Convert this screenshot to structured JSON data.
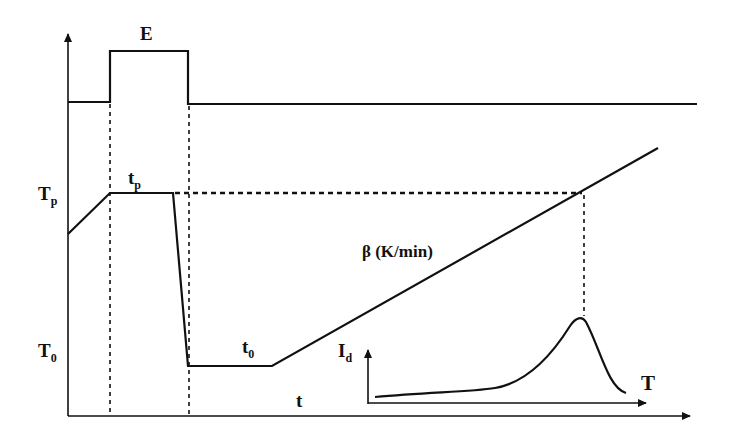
{
  "diagram": {
    "title": "",
    "labels": {
      "E": "E",
      "Tp": "T",
      "Tp_sub": "p",
      "tp": "t",
      "tp_sub": "p",
      "T0": "T",
      "T0_sub": "0",
      "t0": "t",
      "t0_sub": "0",
      "beta": "β (K/min)",
      "t": "t",
      "Id": "I",
      "Id_sub": "d",
      "T": "T"
    },
    "elements": [
      {
        "name": "main-y-axis",
        "desc": "vertical axis with arrow"
      },
      {
        "name": "main-x-axis",
        "desc": "time axis with arrow"
      },
      {
        "name": "field-pulse",
        "desc": "electric field E rectangular pulse during poling"
      },
      {
        "name": "temperature-profile",
        "desc": "heat to Tp, hold tp, quench to T0, hold t0, linear ramp at β"
      },
      {
        "name": "inset-tsdc-peak",
        "desc": "depolarization current Id vs T with peak"
      }
    ],
    "colors": {
      "line": "#111111",
      "background": "#ffffff"
    }
  }
}
